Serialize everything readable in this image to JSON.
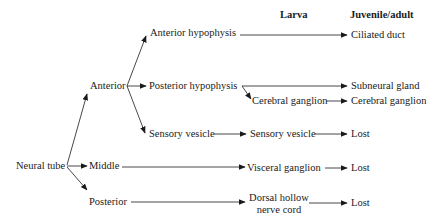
{
  "headers": {
    "larva": "Larva",
    "juvenile_adult": "Juvenile/adult"
  },
  "root": {
    "label": "Neural tube"
  },
  "regions": {
    "anterior": "Anterior",
    "middle": "Middle",
    "posterior": "Posterior"
  },
  "anterior_children": {
    "anterior_hypophysis": "Anterior hypophysis",
    "posterior_hypophysis": "Posterior hypophysis",
    "sensory_vesicle": "Sensory vesicle"
  },
  "larva": {
    "cerebral_ganglion": "Cerebral ganglion",
    "sensory_vesicle": "Sensory vesicle",
    "visceral_ganglion": "Visceral ganglion",
    "dorsal_hollow_line1": "Dorsal hollow",
    "dorsal_hollow_line2": "nerve cord"
  },
  "adult": {
    "ciliated_duct": "Ciliated duct",
    "subneural_gland": "Subneural gland",
    "cerebral_ganglion": "Cerebral ganglion",
    "lost_sensory": "Lost",
    "lost_visceral": "Lost",
    "lost_dorsal": "Lost"
  },
  "colors": {
    "line": "#1a1a1a",
    "background": "#ffffff"
  }
}
